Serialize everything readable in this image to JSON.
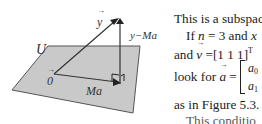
{
  "figure": {
    "plane_label": "U",
    "origin_label": "0",
    "vectors": {
      "y": "y",
      "projection": "Ma",
      "residual": "y−Ma"
    },
    "colors": {
      "plane_fill": "#c9c9c9",
      "plane_edge": "#555555",
      "vector_line": "#333333"
    }
  },
  "text": {
    "line1": "This is a subspac",
    "line2_pre": "If ",
    "line2_n": "n",
    "line2_mid": " = 3 and ",
    "line2_x": "x",
    "line3_pre": "and ",
    "line3_v": "v",
    "line3_post": " =[1  1  1]",
    "line3_sup": "T",
    "line4_pre": "look for ",
    "line4_a": "a",
    "line4_eq": " =",
    "matrix_a0": "a",
    "matrix_a0_sub": "0",
    "matrix_a1": "a",
    "matrix_a1_sub": "1",
    "line5": "as in Figure 5.3.",
    "line6_partial": "This conditio"
  }
}
